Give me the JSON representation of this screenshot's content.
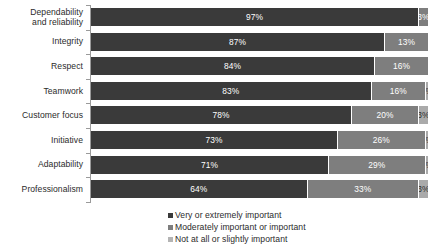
{
  "chart_data": {
    "type": "bar",
    "subtype": "horizontal-stacked-100pct",
    "title": "",
    "subtitle": "",
    "xlabel": "",
    "ylabel": "",
    "xlim": [
      0,
      100
    ],
    "grid": false,
    "legend_position": "bottom",
    "value_suffix": "%",
    "categories": [
      "Dependability and reliability",
      "Integrity",
      "Respect",
      "Teamwork",
      "Customer focus",
      "Initiative",
      "Adaptability",
      "Professionalism"
    ],
    "category_lines": [
      [
        "Dependability",
        "and reliability"
      ],
      [
        "Integrity"
      ],
      [
        "Respect"
      ],
      [
        "Teamwork"
      ],
      [
        "Customer focus"
      ],
      [
        "Initiative"
      ],
      [
        "Adaptability"
      ],
      [
        "Professionalism"
      ]
    ],
    "series": [
      {
        "name": "Very or extremely important",
        "color": "#3a3a3a",
        "values": [
          97,
          87,
          84,
          83,
          78,
          73,
          71,
          64
        ]
      },
      {
        "name": "Moderately important or important",
        "color": "#7e7e7e",
        "values": [
          3,
          13,
          16,
          16,
          20,
          26,
          29,
          33
        ]
      },
      {
        "name": "Not at all or slightly important",
        "color": "#aaaaaa",
        "values": [
          0,
          0,
          0,
          1,
          3,
          1,
          1,
          3
        ]
      }
    ],
    "bar_labels": [
      [
        "97%",
        "3%",
        ""
      ],
      [
        "87%",
        "13%",
        ""
      ],
      [
        "84%",
        "16%",
        ""
      ],
      [
        "83%",
        "16%",
        "1%"
      ],
      [
        "78%",
        "20%",
        "3%"
      ],
      [
        "73%",
        "26%",
        "1%"
      ],
      [
        "71%",
        "29%",
        "1%"
      ],
      [
        "64%",
        "33%",
        "3%"
      ]
    ]
  },
  "legend": {
    "items": [
      {
        "label": "Very or extremely important",
        "color": "#3a3a3a"
      },
      {
        "label": "Moderately important or important",
        "color": "#7e7e7e"
      },
      {
        "label": "Not at all or slightly important",
        "color": "#b4b4b4"
      }
    ]
  },
  "colors": {
    "background": "#ffffff",
    "axis": "#9a9a9a",
    "text": "#2b2b2b",
    "series_1": "#3a3a3a",
    "series_2": "#7e7e7e",
    "series_3": "#aaaaaa"
  }
}
